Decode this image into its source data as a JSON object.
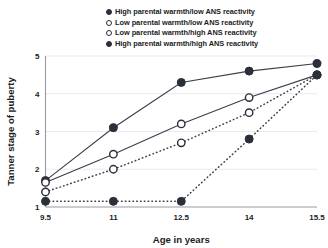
{
  "chart_data": {
    "type": "line",
    "title": "",
    "xlabel": "Age in years",
    "ylabel": "Tanner stage of puberty",
    "x": [
      9.5,
      11,
      12.5,
      14,
      15.5
    ],
    "xticklabels": [
      "9.5",
      "11",
      "12.5",
      "14",
      "15.5"
    ],
    "yticklabels": [
      "1",
      "2",
      "3",
      "4",
      "5"
    ],
    "yticks": [
      1,
      2,
      3,
      4,
      5
    ],
    "xlim": [
      9.5,
      15.5
    ],
    "ylim": [
      1,
      5
    ],
    "grid": "horizontal",
    "legend_position": "top",
    "marker_color": "#2b2f3a",
    "line_color": "#3a3f4c",
    "grid_color": "#e9e9ef",
    "axis_color": "#9a9aa4",
    "series": [
      {
        "name": "High parental warmth/low ANS reactivity",
        "marker": "filled-circle",
        "linestyle": "solid",
        "values": [
          1.7,
          3.1,
          4.3,
          4.6,
          4.8
        ]
      },
      {
        "name": "Low parental warmth/low ANS reactivity",
        "marker": "open-circle",
        "linestyle": "solid",
        "values": [
          1.65,
          2.4,
          3.2,
          3.9,
          4.5
        ]
      },
      {
        "name": "Low parental warmth/high ANS reactivity",
        "marker": "open-circle",
        "linestyle": "dotted",
        "values": [
          1.4,
          2.0,
          2.7,
          3.5,
          4.5
        ]
      },
      {
        "name": "High parental warmth/high ANS reactivity",
        "marker": "filled-circle",
        "linestyle": "dotted",
        "values": [
          1.15,
          1.15,
          1.15,
          2.8,
          4.5
        ]
      }
    ]
  },
  "legend": {
    "items": [
      {
        "label": "High parental warmth/low ANS reactivity",
        "marker": "filled-circle"
      },
      {
        "label": "Low parental warmth/low ANS reactivity",
        "marker": "open-circle"
      },
      {
        "label": "Low parental warmth/high ANS reactivity",
        "marker": "open-circle"
      },
      {
        "label": "High parental warmth/high ANS reactivity",
        "marker": "filled-circle"
      }
    ]
  },
  "axes": {
    "x_title": "Age in years",
    "y_title": "Tanner stage of puberty"
  }
}
